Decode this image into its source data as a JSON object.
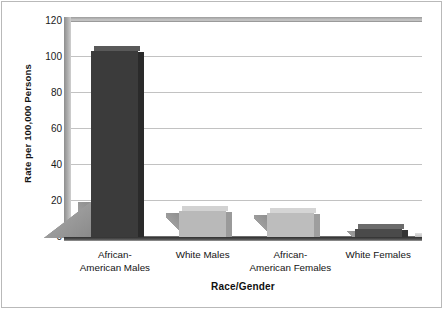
{
  "chart_data": {
    "type": "bar",
    "title": "",
    "xlabel": "Race/Gender",
    "ylabel": "Rate per 100,000 Persons",
    "categories": [
      "African-\nAmerican Males",
      "White Males",
      "African-\nAmerican Females",
      "White Females"
    ],
    "category_lines": [
      [
        "African-",
        "American Males"
      ],
      [
        "White Males",
        ""
      ],
      [
        "African-",
        "American Females"
      ],
      [
        "White Females",
        ""
      ]
    ],
    "values": [
      104,
      15,
      14,
      5
    ],
    "ylim": [
      0,
      120
    ],
    "yticks": [
      0,
      20,
      40,
      60,
      80,
      100,
      120
    ],
    "ytick_labels": [
      "0",
      "20",
      "40",
      "60",
      "80",
      "100",
      "120"
    ],
    "grid": true,
    "legend": "none",
    "bar_colors": [
      "#3b3b3b",
      "#b9b9b9",
      "#bdbdbd",
      "#4a4a4a"
    ],
    "bar_top_colors": [
      "#595959",
      "#d2d2d2",
      "#d5d5d5",
      "#6b6b6b"
    ],
    "bar_side_colors": [
      "#2a2a2a",
      "#9a9a9a",
      "#9e9e9e",
      "#343434"
    ],
    "style": "3d-bar",
    "background_color": "#ffffff",
    "gridline_color": "#c2c2c2",
    "axis_color": "#2f2f2f"
  },
  "axes": {
    "y_title": "Rate per 100,000 Persons",
    "x_title": "Race/Gender"
  }
}
